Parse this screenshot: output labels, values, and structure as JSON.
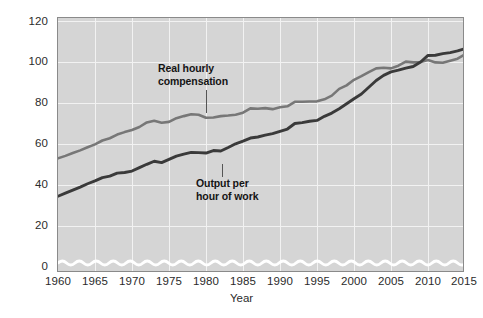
{
  "chart_data": {
    "type": "line",
    "title": "",
    "xlabel": "Year",
    "ylabel": "Index (2009 = 100)",
    "xlim": [
      1960,
      2015
    ],
    "ylim": [
      0,
      120
    ],
    "ylim_visible_break": true,
    "grid": true,
    "legend_position": "inline-annotations",
    "yticks": [
      0,
      20,
      40,
      60,
      80,
      100,
      120
    ],
    "xticks": [
      1960,
      1965,
      1970,
      1975,
      1980,
      1985,
      1990,
      1995,
      2000,
      2005,
      2010,
      2015
    ],
    "colors": {
      "plot_background": "#d5d5d5",
      "gridline": "#f2f2f2",
      "frame": "#8a8a8a",
      "real_hourly_compensation": "#777777",
      "output_per_hour": "#3a3a3a",
      "axis_break": "#ffffff"
    },
    "annotations": [
      {
        "id": "real-hourly-compensation",
        "text_line1": "Real hourly",
        "text_line2": "compensation"
      },
      {
        "id": "output-per-hour-of-work",
        "text_line1": "Output per",
        "text_line2": "hour of work"
      }
    ],
    "series": [
      {
        "name": "Real hourly compensation",
        "color": "#777777",
        "x": [
          1960,
          1961,
          1962,
          1963,
          1964,
          1965,
          1966,
          1967,
          1968,
          1969,
          1970,
          1971,
          1972,
          1973,
          1974,
          1975,
          1976,
          1977,
          1978,
          1979,
          1980,
          1981,
          1982,
          1983,
          1984,
          1985,
          1986,
          1987,
          1988,
          1989,
          1990,
          1991,
          1992,
          1993,
          1994,
          1995,
          1996,
          1997,
          1998,
          1999,
          2000,
          2001,
          2002,
          2003,
          2004,
          2005,
          2006,
          2007,
          2008,
          2009,
          2010,
          2011,
          2012,
          2013,
          2014,
          2015
        ],
        "values": [
          53.0,
          54.2,
          55.6,
          56.9,
          58.4,
          59.8,
          61.7,
          62.8,
          64.6,
          65.8,
          66.8,
          68.3,
          70.5,
          71.3,
          70.4,
          70.8,
          72.6,
          73.6,
          74.5,
          74.3,
          72.8,
          72.9,
          73.6,
          73.9,
          74.3,
          75.3,
          77.4,
          77.2,
          77.5,
          77.0,
          77.9,
          78.4,
          80.6,
          80.6,
          80.7,
          80.8,
          81.8,
          83.6,
          86.9,
          88.6,
          91.3,
          93.1,
          95.1,
          96.9,
          97.2,
          96.9,
          98.2,
          100.2,
          99.8,
          100.0,
          101.0,
          99.8,
          99.6,
          100.6,
          101.6,
          103.7
        ]
      },
      {
        "name": "Output per hour of work",
        "color": "#3a3a3a",
        "x": [
          1960,
          1961,
          1962,
          1963,
          1964,
          1965,
          1966,
          1967,
          1968,
          1969,
          1970,
          1971,
          1972,
          1973,
          1974,
          1975,
          1976,
          1977,
          1978,
          1979,
          1980,
          1981,
          1982,
          1983,
          1984,
          1985,
          1986,
          1987,
          1988,
          1989,
          1990,
          1991,
          1992,
          1993,
          1994,
          1995,
          1996,
          1997,
          1998,
          1999,
          2000,
          2001,
          2002,
          2003,
          2004,
          2005,
          2006,
          2007,
          2008,
          2009,
          2010,
          2011,
          2012,
          2013,
          2014,
          2015
        ],
        "values": [
          34.5,
          36.0,
          37.5,
          39.0,
          40.6,
          42.0,
          43.6,
          44.3,
          45.8,
          46.1,
          46.8,
          48.5,
          50.1,
          51.6,
          50.9,
          52.5,
          54.1,
          55.1,
          55.9,
          55.8,
          55.6,
          56.8,
          56.6,
          58.3,
          60.1,
          61.4,
          62.9,
          63.4,
          64.3,
          65.1,
          66.2,
          67.3,
          70.0,
          70.4,
          71.1,
          71.5,
          73.5,
          75.1,
          77.2,
          79.6,
          82.1,
          84.4,
          87.7,
          91.0,
          93.5,
          95.2,
          96.0,
          97.0,
          97.8,
          100.0,
          103.2,
          103.3,
          104.1,
          104.6,
          105.4,
          106.5
        ]
      }
    ]
  }
}
